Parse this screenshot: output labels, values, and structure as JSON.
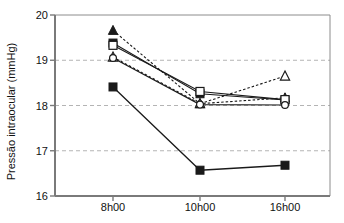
{
  "chart_data": {
    "type": "line",
    "title": "",
    "subtitle": "",
    "xlabel": "",
    "ylabel": "Pressão intraocular (mmHg)",
    "categories": [
      "8h00",
      "10h00",
      "16h00"
    ],
    "x_tick_labels": [
      "8h00",
      "10h00",
      "16h00"
    ],
    "y_tick_labels": [
      "16",
      "17",
      "18",
      "19",
      "20"
    ],
    "y_ticks": [
      16,
      17,
      18,
      19,
      20
    ],
    "ylim": [
      16,
      20
    ],
    "grid": "horizontal dashed gray gridlines at 17, 18, 19",
    "gridlines": [
      17,
      18,
      19
    ],
    "legend": "none",
    "legend_position": "none",
    "annotations": [],
    "series": [
      {
        "name": "series-1-filled-triangle",
        "marker": "filled-triangle",
        "line_style": "dashed",
        "color": "#1a1a1a",
        "values": [
          19.66,
          18.04,
          18.17
        ]
      },
      {
        "name": "series-2-filled-square",
        "marker": "filled-square",
        "line_style": "solid",
        "color": "#1a1a1a",
        "values": [
          19.38,
          18.26,
          18.12
        ]
      },
      {
        "name": "series-3-open-square",
        "marker": "open-square",
        "line_style": "solid",
        "color": "#1a1a1a",
        "values": [
          19.33,
          18.31,
          18.13
        ]
      },
      {
        "name": "series-4-open-triangle",
        "marker": "open-triangle",
        "line_style": "dashed",
        "color": "#1a1a1a",
        "values": [
          19.07,
          18.04,
          18.65
        ]
      },
      {
        "name": "series-5-open-circle",
        "marker": "open-circle",
        "line_style": "solid",
        "color": "#1a1a1a",
        "values": [
          19.05,
          18.02,
          18.01
        ]
      },
      {
        "name": "series-6-filled-square-low",
        "marker": "filled-square",
        "line_style": "solid",
        "color": "#1a1a1a",
        "values": [
          18.41,
          16.57,
          16.68
        ]
      }
    ]
  },
  "axes": {
    "y_axis_line_color": "#7a7a7a",
    "x_axis_line_color": "#7a7a7a",
    "grid_color": "#b4b4b4",
    "plot_background": "#ffffff"
  }
}
